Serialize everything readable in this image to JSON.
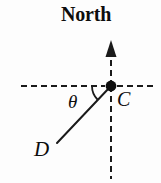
{
  "figure": {
    "tag": ")",
    "background_color": "#fdfdfd",
    "stroke_color": "#1a1a1a",
    "labels": {
      "north": "North",
      "point_c": "C",
      "point_d": "D",
      "angle": "θ"
    },
    "elements": {
      "north_axis_name": "north-direction-axis",
      "horizontal_axis_name": "horizontal-reference-axis",
      "bearing_line_name": "bearing-line-cd",
      "angle_arc_name": "angle-arc-theta",
      "vertex_name": "point-c-marker"
    },
    "geometry": {
      "vertex_x": 111,
      "vertex_y": 86,
      "north_arrow_tip_y": 42,
      "vertical_line_bottom_y": 179,
      "horizontal_line_left_x": 21,
      "horizontal_line_right_x": 153,
      "bearing_end_x": 57,
      "bearing_end_y": 143,
      "bearing_angle_deg": 45,
      "dash_pattern": "6 4"
    }
  }
}
